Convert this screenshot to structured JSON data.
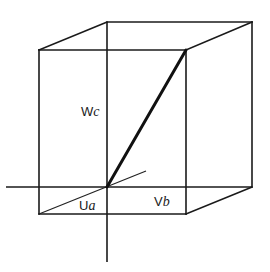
{
  "diagram": {
    "labels": {
      "w_axis": {
        "main": "W",
        "sub": "c"
      },
      "u_axis": {
        "main": "U",
        "sub": "a"
      },
      "v_axis": {
        "main": "V",
        "sub": "b"
      }
    },
    "colors": {
      "line": "#1a1a1a",
      "background": "#ffffff"
    }
  }
}
